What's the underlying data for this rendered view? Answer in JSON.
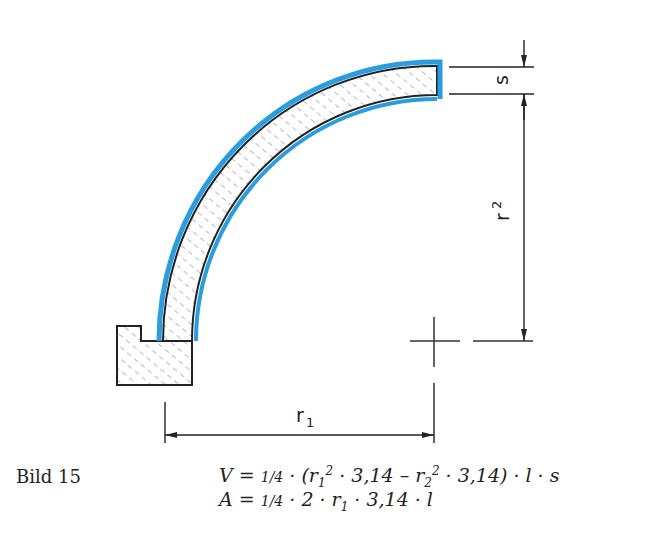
{
  "figure": {
    "caption": "Bild 15",
    "colors": {
      "highlight": "#2a9de0",
      "line": "#222222",
      "background": "#ffffff"
    },
    "dimensions": {
      "s_label": "s",
      "r2_label": "r",
      "r2_sub": "2",
      "r1_label": "r",
      "r1_sub": "1"
    },
    "formulas": {
      "volume": {
        "lhs": "V",
        "text": "V = ¼ · (r₁² · 3,14 – r₂² · 3,14) · l · s",
        "parts": {
          "eq": " = ",
          "frac": "1/4",
          "dot": " · ",
          "open": "(r",
          "sub1": "1",
          "sup1": "2",
          "mid1": " · 3,14 – r",
          "sub2": "2",
          "sup2": "2",
          "mid2": " · 3,14) · l · s"
        }
      },
      "area": {
        "lhs": "A",
        "text": "A = ¼ · 2 · r₁ · 3,14 · l",
        "parts": {
          "eq": " = ",
          "frac": "1/4",
          "mid": " · 2 · r",
          "sub1": "1",
          "tail": " · 3,14 · l"
        }
      }
    }
  }
}
